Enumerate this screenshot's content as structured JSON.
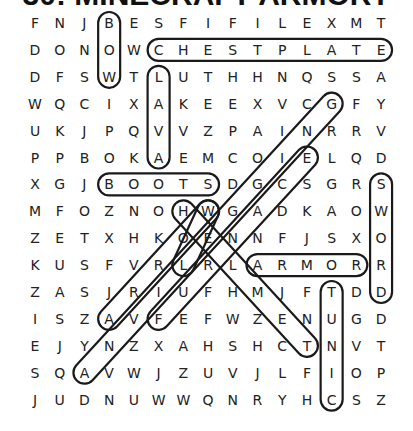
{
  "title": "30: MINECRAFT ARMORY",
  "grid": {
    "rows": [
      "FNJBESFIFILEXMT",
      "DONOWCHESTPLATE",
      "DFSWTLUTHHNQSSA",
      "WQCIXAKEEXVCGFY",
      "UKJPQVVZPAINRRV",
      "PPBOKAEMCOIELQD",
      "XGJBOOTSDGCSGRS",
      "MFOZNOHWGADKAOW",
      "ZETXHKOENNFJSXO",
      "KUSFVRLRLARMORR",
      "ZASJRIUFHMJFTDD",
      "ISZAVFEFWZENUGD",
      "EJYNZXAHSHCTNVT",
      "SQAVWJZUVJLFIOP",
      "JUDNUWWQNRYHCSZ"
    ]
  },
  "found_words": [
    {
      "word": "BOW",
      "start": [
        0,
        3
      ],
      "end": [
        2,
        3
      ]
    },
    {
      "word": "CHESTPLATE",
      "start": [
        1,
        5
      ],
      "end": [
        1,
        14
      ]
    },
    {
      "word": "LAVA",
      "start": [
        2,
        5
      ],
      "end": [
        5,
        5
      ]
    },
    {
      "word": "BOOTS",
      "start": [
        6,
        3
      ],
      "end": [
        6,
        7
      ]
    },
    {
      "word": "SWORD",
      "start": [
        6,
        14
      ],
      "end": [
        10,
        14
      ]
    },
    {
      "word": "ARMOR",
      "start": [
        9,
        9
      ],
      "end": [
        9,
        13
      ]
    },
    {
      "word": "TUNIC",
      "start": [
        10,
        12
      ],
      "end": [
        14,
        12
      ]
    },
    {
      "word": "HELMET",
      "start": [
        7,
        6
      ],
      "end": [
        12,
        11
      ]
    },
    {
      "word": "ARROW",
      "start": [
        11,
        3
      ],
      "end": [
        7,
        7
      ]
    },
    {
      "word": "FURNACE",
      "start": [
        11,
        5
      ],
      "end": [
        5,
        11
      ]
    },
    {
      "word": "LEGGINGS",
      "start": [
        13,
        2
      ],
      "end": [
        3,
        12
      ]
    },
    {
      "word": "WOL",
      "start": [
        7,
        7
      ],
      "end": [
        9,
        6
      ]
    }
  ],
  "colors": {
    "text": "#222222",
    "loop": "#1a1a1a",
    "background": "#ffffff"
  }
}
